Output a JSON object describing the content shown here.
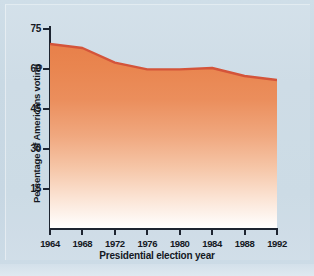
{
  "figure": {
    "background_color": "#c6d7e3",
    "panel_color": "#cfdee8"
  },
  "chart_data": {
    "type": "area",
    "title": "",
    "xlabel": "Presidential election year",
    "ylabel": "Percentage of Americans voting",
    "categories": [
      "1964",
      "1968",
      "1972",
      "1976",
      "1980",
      "1984",
      "1988",
      "1992"
    ],
    "x": [
      1964,
      1968,
      1972,
      1976,
      1980,
      1984,
      1988,
      1992
    ],
    "values": [
      69,
      67.5,
      62,
      59.5,
      59.5,
      60,
      57,
      55.5
    ],
    "series": [
      {
        "name": "Percentage of Americans voting",
        "values": [
          69,
          67.5,
          62,
          59.5,
          59.5,
          60,
          57,
          55.5
        ]
      }
    ],
    "xlim": [
      1964,
      1992
    ],
    "ylim": [
      0,
      75
    ],
    "yticks": [
      15,
      30,
      45,
      60,
      75
    ],
    "ytick_labels": [
      "15",
      "30",
      "45",
      "60",
      "75"
    ],
    "xticks": [
      1964,
      1968,
      1972,
      1976,
      1980,
      1984,
      1988,
      1992
    ],
    "xtick_labels": [
      "1964",
      "1968",
      "1972",
      "1976",
      "1980",
      "1984",
      "1988",
      "1992"
    ],
    "grid": false,
    "legend": false,
    "legend_position": "none",
    "fill_top_color": "#e8814a",
    "fill_bottom_color": "#ffffff",
    "line_color": "#d4543a",
    "axis_color": "#1d2430"
  }
}
